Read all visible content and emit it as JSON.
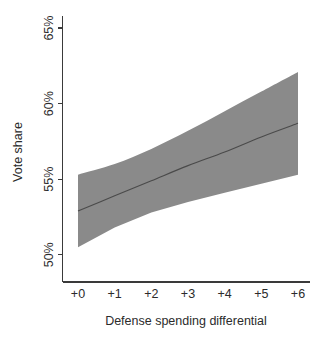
{
  "figure": {
    "width": 324,
    "height": 341,
    "background_color": "#ffffff"
  },
  "chart_data": {
    "type": "line",
    "title": "",
    "subtitle": "",
    "xlabel": "Defense spending differential",
    "ylabel": "Vote share",
    "x": [
      0,
      1,
      2,
      3,
      4,
      5,
      6
    ],
    "xtick_labels": [
      "+0",
      "+1",
      "+2",
      "+3",
      "+4",
      "+5",
      "+6"
    ],
    "ytick_values": [
      50,
      55,
      60,
      65
    ],
    "ytick_labels": [
      "50%",
      "55%",
      "60%",
      "65%"
    ],
    "xlim": [
      0,
      6
    ],
    "ylim": [
      48.2,
      65.8
    ],
    "grid": false,
    "legend": "none",
    "series": [
      {
        "name": "Predicted vote share",
        "kind": "line",
        "color": "#4a4a4a",
        "values": [
          52.9,
          53.9,
          54.9,
          55.9,
          56.8,
          57.8,
          58.7
        ]
      },
      {
        "name": "Confidence interval upper",
        "kind": "band-upper",
        "values": [
          55.3,
          56.0,
          57.0,
          58.2,
          59.5,
          60.8,
          62.1
        ]
      },
      {
        "name": "Confidence interval lower",
        "kind": "band-lower",
        "values": [
          50.5,
          51.8,
          52.8,
          53.5,
          54.1,
          54.7,
          55.3
        ]
      }
    ],
    "band": {
      "name": "Confidence interval",
      "fill_color": "#8a8a8a",
      "opacity": 1
    },
    "axis_color": "#3a3a3a",
    "text_color": "#2b2b2b"
  },
  "axes": {
    "y_axis_label": "Vote share",
    "x_axis_label": "Defense spending differential",
    "y_ticks": [
      {
        "label": "65%",
        "value": 65
      },
      {
        "label": "60%",
        "value": 60
      },
      {
        "label": "55%",
        "value": 55
      },
      {
        "label": "50%",
        "value": 50
      }
    ],
    "x_ticks": [
      {
        "label": "+0",
        "value": 0
      },
      {
        "label": "+1",
        "value": 1
      },
      {
        "label": "+2",
        "value": 2
      },
      {
        "label": "+3",
        "value": 3
      },
      {
        "label": "+4",
        "value": 4
      },
      {
        "label": "+5",
        "value": 5
      },
      {
        "label": "+6",
        "value": 6
      }
    ]
  }
}
